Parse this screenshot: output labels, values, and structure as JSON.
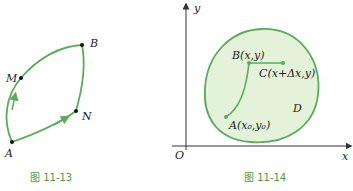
{
  "figure_left": {
    "caption": "图 11-13",
    "points": {
      "A": "A",
      "M": "M",
      "B": "B",
      "N": "N"
    }
  },
  "figure_right": {
    "caption": "图 11-14",
    "axes": {
      "x": "x",
      "y": "y",
      "origin": "O"
    },
    "region_label": "D",
    "points": {
      "A": "A(x₀,y₀)",
      "B": "B(x,y)",
      "C": "C(x+Δx,y)"
    }
  },
  "colors": {
    "curve": "#5aab5a",
    "region_fill": "#e3f2d8",
    "caption": "#4a9a4a",
    "axis": "#333333"
  }
}
